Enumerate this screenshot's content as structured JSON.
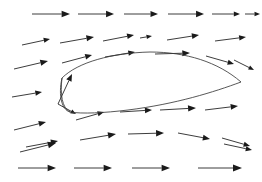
{
  "figure": {
    "background_color": "#ffffff",
    "width": 262,
    "height": 182,
    "vector_color": "#262626",
    "airfoil_color": "#3a3a3a"
  },
  "chart_data": {
    "type": "scatter",
    "subtitle": "Potential-flow style quiver plot with airfoil body",
    "xlabel": "",
    "ylabel": "",
    "xlim": [
      0,
      262
    ],
    "ylim": [
      0,
      182
    ],
    "grid": false,
    "legend": "none",
    "tick_labels_x": [],
    "tick_labels_y": [],
    "annotations": [],
    "series": [
      {
        "name": "velocity-vectors",
        "glyph": "arrow",
        "units": "pixels",
        "note": "Each vector given as tail x,y to head x,y in image pixel coordinates (origin top-left)",
        "vectors": [
          {
            "x1": 32,
            "y1": 14,
            "x2": 70,
            "y2": 14
          },
          {
            "x1": 78,
            "y1": 14,
            "x2": 114,
            "y2": 14
          },
          {
            "x1": 124,
            "y1": 14,
            "x2": 158,
            "y2": 14
          },
          {
            "x1": 168,
            "y1": 14,
            "x2": 204,
            "y2": 14
          },
          {
            "x1": 212,
            "y1": 14,
            "x2": 240,
            "y2": 14
          },
          {
            "x1": 245,
            "y1": 14,
            "x2": 260,
            "y2": 14
          },
          {
            "x1": 22,
            "y1": 45,
            "x2": 50,
            "y2": 39
          },
          {
            "x1": 60,
            "y1": 43,
            "x2": 94,
            "y2": 37
          },
          {
            "x1": 103,
            "y1": 41,
            "x2": 134,
            "y2": 35
          },
          {
            "x1": 140,
            "y1": 38,
            "x2": 152,
            "y2": 36
          },
          {
            "x1": 167,
            "y1": 40,
            "x2": 199,
            "y2": 35
          },
          {
            "x1": 215,
            "y1": 41,
            "x2": 246,
            "y2": 37
          },
          {
            "x1": 14,
            "y1": 69,
            "x2": 48,
            "y2": 61
          },
          {
            "x1": 62,
            "y1": 63,
            "x2": 92,
            "y2": 55
          },
          {
            "x1": 105,
            "y1": 57,
            "x2": 135,
            "y2": 52
          },
          {
            "x1": 155,
            "y1": 54,
            "x2": 190,
            "y2": 53
          },
          {
            "x1": 206,
            "y1": 56,
            "x2": 234,
            "y2": 64
          },
          {
            "x1": 234,
            "y1": 60,
            "x2": 254,
            "y2": 70
          },
          {
            "x1": 12,
            "y1": 97,
            "x2": 42,
            "y2": 92
          },
          {
            "x1": 58,
            "y1": 104,
            "x2": 72,
            "y2": 74
          },
          {
            "x1": 58,
            "y1": 104,
            "x2": 76,
            "y2": 114
          },
          {
            "x1": 76,
            "y1": 120,
            "x2": 104,
            "y2": 112
          },
          {
            "x1": 120,
            "y1": 112,
            "x2": 152,
            "y2": 110
          },
          {
            "x1": 160,
            "y1": 110,
            "x2": 196,
            "y2": 108
          },
          {
            "x1": 205,
            "y1": 110,
            "x2": 238,
            "y2": 106
          },
          {
            "x1": 14,
            "y1": 130,
            "x2": 46,
            "y2": 122
          },
          {
            "x1": 20,
            "y1": 152,
            "x2": 56,
            "y2": 143
          },
          {
            "x1": 80,
            "y1": 140,
            "x2": 116,
            "y2": 134
          },
          {
            "x1": 128,
            "y1": 134,
            "x2": 164,
            "y2": 133
          },
          {
            "x1": 178,
            "y1": 133,
            "x2": 210,
            "y2": 139
          },
          {
            "x1": 222,
            "y1": 138,
            "x2": 250,
            "y2": 146
          },
          {
            "x1": 26,
            "y1": 147,
            "x2": 58,
            "y2": 141
          },
          {
            "x1": 224,
            "y1": 144,
            "x2": 252,
            "y2": 150
          },
          {
            "x1": 18,
            "y1": 168,
            "x2": 56,
            "y2": 168
          },
          {
            "x1": 74,
            "y1": 168,
            "x2": 112,
            "y2": 168
          },
          {
            "x1": 132,
            "y1": 168,
            "x2": 170,
            "y2": 168
          },
          {
            "x1": 198,
            "y1": 168,
            "x2": 242,
            "y2": 168
          }
        ]
      },
      {
        "name": "airfoil-body",
        "glyph": "closed-curve",
        "note": "Airfoil cross-section outline, leading edge left at about x=62, trailing edge right at about x=241",
        "leading_edge": [
          62,
          78
        ],
        "trailing_edge": [
          241,
          82
        ],
        "chord_px": 179,
        "thickness_px": 34
      }
    ]
  }
}
